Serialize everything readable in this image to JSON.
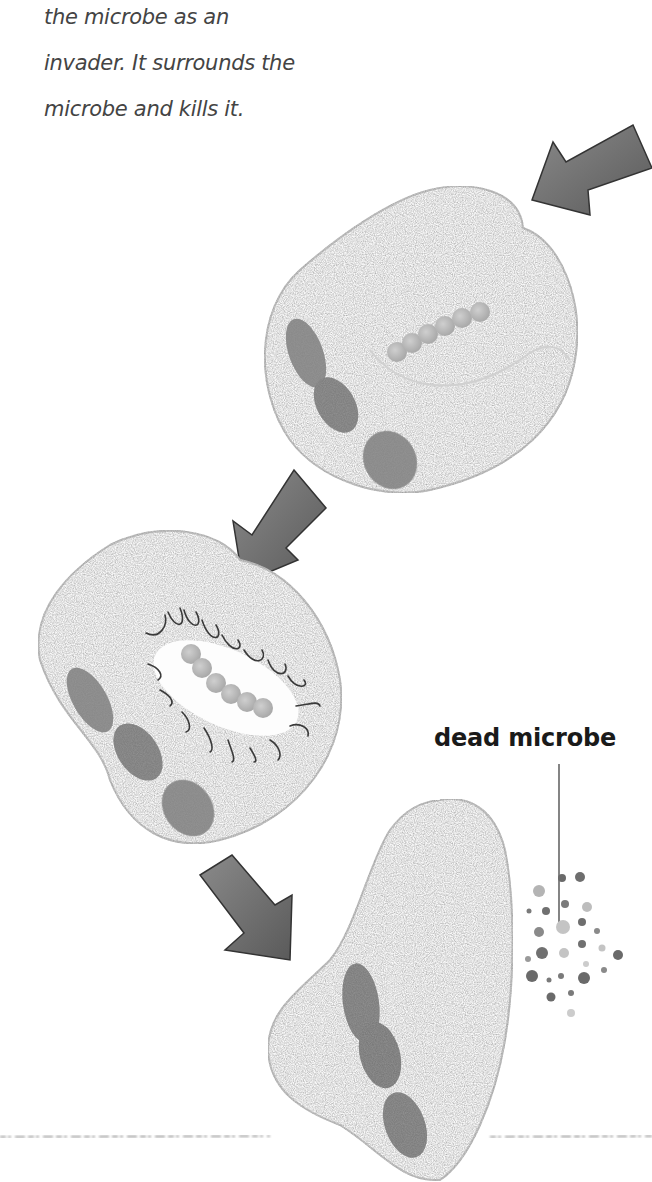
{
  "caption": {
    "lines": [
      "the microbe as an",
      "invader. It surrounds the",
      "microbe and kills it."
    ]
  },
  "labels": {
    "dead_microbe": "dead microbe"
  },
  "stages": [
    {
      "name": "engulfing",
      "description": "phagocyte approaches chain-shaped microbe"
    },
    {
      "name": "killing",
      "description": "microbe enclosed and destroyed"
    },
    {
      "name": "digested",
      "description": "dead microbe fragments released"
    }
  ],
  "colors": {
    "arrow": "#6b6b6b",
    "arrow_outline": "#333333",
    "cell_outline": "#bdbdbd",
    "microbe_bead": "#b8b8b8",
    "nucleus": "#7a7a7a",
    "text": "#444444"
  }
}
